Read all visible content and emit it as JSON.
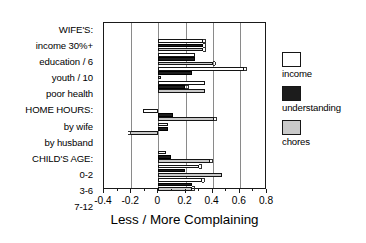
{
  "chart_data": {
    "type": "bar",
    "orientation": "horizontal",
    "title": "",
    "xlabel": "Less / More Complaining",
    "ylabel": "",
    "xlim": [
      -0.4,
      0.8
    ],
    "xticks": [
      -0.4,
      -0.2,
      0,
      0.2,
      0.4,
      0.6,
      0.8
    ],
    "xticklabels": [
      "-0.4",
      "-0.2",
      "0",
      "0.2",
      "0.4",
      "0.6",
      "0.8"
    ],
    "grid": "vertical gridlines at each major x tick",
    "legend_position": "right, outside plot",
    "legend": [
      "income",
      "understanding",
      "chores"
    ],
    "series_colors": {
      "income": "#ffffff",
      "understanding": "#1c1c1c",
      "chores": "#c9c9c9"
    },
    "categories": [
      "WIFE'S:",
      "income 30%+",
      "education / 6",
      "youth / 10",
      "poor health",
      "HOME HOURS:",
      "by wife",
      "by husband",
      "CHILD'S AGE:",
      "0-2",
      "3-6",
      "7-12"
    ],
    "category_is_header": [
      true,
      false,
      false,
      false,
      false,
      true,
      false,
      false,
      true,
      false,
      false,
      false
    ],
    "series": [
      {
        "name": "income",
        "values": [
          null,
          0.33,
          0.27,
          0.63,
          0.34,
          null,
          -0.11,
          0.07,
          null,
          0.06,
          0.3,
          0.32
        ]
      },
      {
        "name": "understanding",
        "values": [
          null,
          0.33,
          0.27,
          0.25,
          0.2,
          null,
          0.11,
          0.07,
          null,
          0.09,
          0.2,
          0.25
        ]
      },
      {
        "name": "chores",
        "values": [
          null,
          0.33,
          0.4,
          0.02,
          0.34,
          null,
          0.41,
          -0.21,
          null,
          0.38,
          0.47,
          0.25
        ]
      }
    ],
    "error_bars": {
      "income": [
        null,
        0.015,
        0.0,
        0.015,
        0.0,
        null,
        0.0,
        0.0,
        null,
        0.0,
        0.015,
        0.015
      ],
      "understanding": [
        null,
        0.015,
        0.0,
        0.0,
        0.015,
        null,
        0.0,
        0.0,
        null,
        0.0,
        0.0,
        0.0
      ],
      "chores": [
        null,
        0.015,
        0.015,
        0.0,
        0.0,
        null,
        0.015,
        0.015,
        null,
        0.015,
        0.0,
        0.015
      ]
    }
  },
  "legend": {
    "items": [
      {
        "label": "income",
        "swatch": "income"
      },
      {
        "label": "understanding",
        "swatch": "understanding"
      },
      {
        "label": "chores",
        "swatch": "chores"
      }
    ]
  }
}
